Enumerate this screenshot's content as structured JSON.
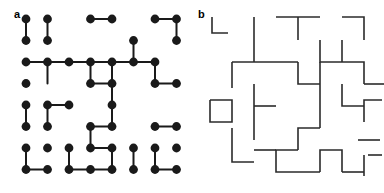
{
  "figure": {
    "background": "#ffffff",
    "ink_color": "#1a1a1a",
    "line_color": "#2b2b2b"
  },
  "panels": [
    {
      "id": "a",
      "label": "a",
      "type": "dimer-covering",
      "description": "Square lattice of vertices with dimers (bonds) covering pairs of adjacent vertices",
      "grid": {
        "cols": 8,
        "rows": 8,
        "x0": 26,
        "y0": 19,
        "dx": 21.5,
        "dy": 21.5,
        "dot_radius": 4.4
      },
      "vertices": [
        [
          0,
          0
        ],
        [
          1,
          0
        ],
        [
          3,
          0
        ],
        [
          4,
          0
        ],
        [
          6,
          0
        ],
        [
          7,
          0
        ],
        [
          0,
          1
        ],
        [
          1,
          1
        ],
        [
          5,
          1
        ],
        [
          7,
          1
        ],
        [
          1,
          2
        ],
        [
          2,
          2
        ],
        [
          3,
          2
        ],
        [
          4,
          2
        ],
        [
          5,
          2
        ],
        [
          6,
          2
        ],
        [
          0,
          2
        ],
        [
          0,
          3
        ],
        [
          3,
          3
        ],
        [
          4,
          3
        ],
        [
          6,
          3
        ],
        [
          7,
          3
        ],
        [
          0,
          4
        ],
        [
          1,
          4
        ],
        [
          2,
          4
        ],
        [
          4,
          4
        ],
        [
          0,
          5
        ],
        [
          1,
          5
        ],
        [
          3,
          5
        ],
        [
          4,
          5
        ],
        [
          6,
          5
        ],
        [
          7,
          5
        ],
        [
          2,
          6
        ],
        [
          3,
          6
        ],
        [
          4,
          6
        ],
        [
          6,
          6
        ],
        [
          0,
          6
        ],
        [
          0,
          7
        ],
        [
          1,
          7
        ],
        [
          3,
          7
        ],
        [
          4,
          7
        ],
        [
          5,
          7
        ],
        [
          6,
          7
        ],
        [
          7,
          7
        ],
        [
          1,
          6
        ],
        [
          5,
          6
        ],
        [
          7,
          6
        ],
        [
          2,
          7
        ]
      ],
      "dimers": [
        {
          "from": [
            0,
            0
          ],
          "to": [
            0,
            1
          ],
          "orient": "vertical"
        },
        {
          "from": [
            1,
            0
          ],
          "to": [
            1,
            1
          ],
          "orient": "vertical"
        },
        {
          "from": [
            3,
            0
          ],
          "to": [
            4,
            0
          ],
          "orient": "horizontal"
        },
        {
          "from": [
            6,
            0
          ],
          "to": [
            7,
            0
          ],
          "orient": "horizontal"
        },
        {
          "from": [
            7,
            0
          ],
          "to": [
            7,
            1
          ],
          "orient": "vertical"
        },
        {
          "from": [
            5,
            1
          ],
          "to": [
            5,
            2
          ],
          "orient": "vertical"
        },
        {
          "from": [
            0,
            2
          ],
          "to": [
            1,
            2
          ],
          "orient": "horizontal"
        },
        {
          "from": [
            1,
            2
          ],
          "to": [
            2,
            2
          ],
          "orient": "horizontal"
        },
        {
          "from": [
            2,
            2
          ],
          "to": [
            3,
            2
          ],
          "orient": "horizontal"
        },
        {
          "from": [
            3,
            2
          ],
          "to": [
            4,
            2
          ],
          "orient": "horizontal"
        },
        {
          "from": [
            4,
            2
          ],
          "to": [
            5,
            2
          ],
          "orient": "horizontal"
        },
        {
          "from": [
            5,
            2
          ],
          "to": [
            6,
            2
          ],
          "orient": "horizontal"
        },
        {
          "from": [
            1,
            2
          ],
          "to": [
            1,
            3
          ],
          "orient": "vertical"
        },
        {
          "from": [
            3,
            2
          ],
          "to": [
            3,
            3
          ],
          "orient": "vertical"
        },
        {
          "from": [
            4,
            2
          ],
          "to": [
            4,
            3
          ],
          "orient": "vertical"
        },
        {
          "from": [
            6,
            2
          ],
          "to": [
            6,
            3
          ],
          "orient": "vertical"
        },
        {
          "from": [
            3,
            3
          ],
          "to": [
            4,
            3
          ],
          "orient": "horizontal"
        },
        {
          "from": [
            6,
            3
          ],
          "to": [
            7,
            3
          ],
          "orient": "horizontal"
        },
        {
          "from": [
            0,
            4
          ],
          "to": [
            0,
            5
          ],
          "orient": "vertical"
        },
        {
          "from": [
            1,
            4
          ],
          "to": [
            2,
            4
          ],
          "orient": "horizontal"
        },
        {
          "from": [
            1,
            4
          ],
          "to": [
            1,
            5
          ],
          "orient": "vertical"
        },
        {
          "from": [
            4,
            3
          ],
          "to": [
            4,
            4
          ],
          "orient": "vertical"
        },
        {
          "from": [
            3,
            5
          ],
          "to": [
            4,
            5
          ],
          "orient": "horizontal"
        },
        {
          "from": [
            3,
            5
          ],
          "to": [
            3,
            6
          ],
          "orient": "vertical"
        },
        {
          "from": [
            6,
            5
          ],
          "to": [
            7,
            5
          ],
          "orient": "horizontal"
        },
        {
          "from": [
            3,
            6
          ],
          "to": [
            4,
            6
          ],
          "orient": "horizontal"
        },
        {
          "from": [
            4,
            6
          ],
          "to": [
            4,
            7
          ],
          "orient": "vertical"
        },
        {
          "from": [
            6,
            6
          ],
          "to": [
            6,
            7
          ],
          "orient": "vertical"
        },
        {
          "from": [
            0,
            6
          ],
          "to": [
            0,
            7
          ],
          "orient": "vertical"
        },
        {
          "from": [
            0,
            7
          ],
          "to": [
            1,
            7
          ],
          "orient": "horizontal"
        },
        {
          "from": [
            2,
            7
          ],
          "to": [
            3,
            7
          ],
          "orient": "horizontal"
        },
        {
          "from": [
            3,
            7
          ],
          "to": [
            4,
            7
          ],
          "orient": "horizontal"
        },
        {
          "from": [
            6,
            7
          ],
          "to": [
            7,
            7
          ],
          "orient": "horizontal"
        },
        {
          "from": [
            2,
            6
          ],
          "to": [
            2,
            7
          ],
          "orient": "vertical"
        },
        {
          "from": [
            5,
            6
          ],
          "to": [
            5,
            7
          ],
          "orient": "vertical"
        },
        {
          "from": [
            4,
            4
          ],
          "to": [
            4,
            5
          ],
          "orient": "vertical"
        }
      ]
    },
    {
      "id": "b",
      "label": "b",
      "type": "loop-segment-representation",
      "description": "Dual lattice representation: orthogonal line segments and corners forming open and closed loops",
      "grid": {
        "x0": 18,
        "y0": 17,
        "step": 21.5
      },
      "segments": [
        {
          "points": [
            [
              20,
              17
            ],
            [
              20,
              33
            ],
            [
              36,
              33
            ]
          ]
        },
        {
          "points": [
            [
              62,
              17
            ],
            [
              62,
              62
            ]
          ]
        },
        {
          "points": [
            [
              84,
              17
            ],
            [
              128,
              17
            ]
          ]
        },
        {
          "points": [
            [
              106,
              17
            ],
            [
              106,
              40
            ]
          ]
        },
        {
          "points": [
            [
              150,
              17
            ],
            [
              172,
              17
            ],
            [
              172,
              40
            ]
          ]
        },
        {
          "points": [
            [
              40,
              62
            ],
            [
              40,
              88
            ]
          ]
        },
        {
          "points": [
            [
              40,
              62
            ],
            [
              106,
              62
            ]
          ]
        },
        {
          "points": [
            [
              106,
              62
            ],
            [
              106,
              84
            ],
            [
              128,
              84
            ]
          ]
        },
        {
          "points": [
            [
              128,
              40
            ],
            [
              128,
              62
            ],
            [
              150,
              62
            ]
          ]
        },
        {
          "points": [
            [
              128,
              62
            ],
            [
              128,
              128
            ]
          ]
        },
        {
          "points": [
            [
              150,
              62
            ],
            [
              150,
              40
            ]
          ]
        },
        {
          "points": [
            [
              150,
              62
            ],
            [
              172,
              62
            ],
            [
              172,
              84
            ]
          ]
        },
        {
          "points": [
            [
              172,
              84
            ],
            [
              192,
              84
            ]
          ]
        },
        {
          "points": [
            [
              62,
              84
            ],
            [
              62,
              140
            ]
          ]
        },
        {
          "points": [
            [
              62,
              106
            ],
            [
              84,
              106
            ]
          ]
        },
        {
          "points": [
            [
              18,
              100
            ],
            [
              40,
              100
            ],
            [
              40,
              122
            ],
            [
              18,
              122
            ],
            [
              18,
              100
            ]
          ]
        },
        {
          "points": [
            [
              150,
              84
            ],
            [
              150,
              106
            ],
            [
              172,
              106
            ]
          ]
        },
        {
          "points": [
            [
              190,
              100
            ],
            [
              172,
              100
            ],
            [
              172,
              122
            ]
          ]
        },
        {
          "points": [
            [
              128,
              128
            ],
            [
              106,
              128
            ],
            [
              106,
              150
            ]
          ]
        },
        {
          "points": [
            [
              106,
              150
            ],
            [
              84,
              150
            ],
            [
              84,
              172
            ],
            [
              128,
              172
            ]
          ]
        },
        {
          "points": [
            [
              128,
              172
            ],
            [
              128,
              150
            ],
            [
              150,
              150
            ],
            [
              150,
              172
            ]
          ]
        },
        {
          "points": [
            [
              150,
              172
            ],
            [
              172,
              172
            ]
          ]
        },
        {
          "points": [
            [
              62,
              150
            ],
            [
              84,
              150
            ]
          ]
        },
        {
          "points": [
            [
              40,
              140
            ],
            [
              40,
              162
            ],
            [
              62,
              162
            ]
          ]
        },
        {
          "points": [
            [
              40,
              140
            ],
            [
              40,
              128
            ]
          ]
        },
        {
          "points": [
            [
              166,
              140
            ],
            [
              188,
              140
            ]
          ]
        },
        {
          "points": [
            [
              172,
              155
            ],
            [
              172,
              176
            ]
          ]
        },
        {
          "points": [
            [
              190,
              155
            ],
            [
              176,
              155
            ]
          ]
        }
      ]
    }
  ]
}
